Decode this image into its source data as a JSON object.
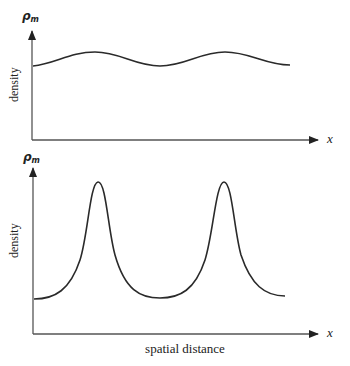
{
  "figure": {
    "panels": [
      {
        "name": "top",
        "y_axis_symbol": "ρ",
        "y_axis_subscript": "m",
        "y_axis_label": "density",
        "x_axis_symbol": "x",
        "curve_description": "small-amplitude sinusoidal density variation"
      },
      {
        "name": "bottom",
        "y_axis_symbol": "ρ",
        "y_axis_subscript": "m",
        "y_axis_label": "density",
        "x_axis_symbol": "x",
        "x_axis_label": "spatial distance",
        "curve_description": "sharply peaked density waves"
      }
    ],
    "colors": {
      "line": "#2a2a2a",
      "axis": "#555555",
      "background": "#ffffff"
    }
  }
}
